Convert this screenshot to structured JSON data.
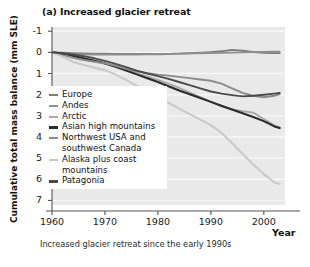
{
  "chart_data": {
    "type": "line",
    "title": "(a) Increased glacier retreat",
    "xlabel": "Year",
    "ylabel": "Cumulative total mass balance (mm SLE)",
    "caption": "Increased glacier retreat since the early 1990s",
    "xlim": [
      1960,
      2004
    ],
    "ylim": [
      7.5,
      -1.2
    ],
    "y_inverted": true,
    "grid": true,
    "legend_position": "inside-left",
    "xticks": [
      1960,
      1970,
      1980,
      1990,
      2000
    ],
    "xtick_labels": [
      "1960",
      "1970",
      "1980",
      "1990",
      "2000"
    ],
    "yticks": [
      -1,
      0,
      1,
      2,
      3,
      4,
      5,
      6,
      7
    ],
    "ytick_labels": [
      "-1",
      "0",
      "1",
      "2",
      "3",
      "4",
      "5",
      "6",
      "7"
    ],
    "x": [
      1960,
      1962,
      1964,
      1966,
      1968,
      1970,
      1972,
      1974,
      1976,
      1978,
      1980,
      1982,
      1984,
      1986,
      1988,
      1990,
      1992,
      1994,
      1996,
      1998,
      2000,
      2002,
      2003
    ],
    "series": [
      {
        "name": "Europe",
        "color": "#7d7d7d",
        "width": 1.9,
        "values": [
          0.0,
          0.02,
          0.04,
          0.05,
          0.06,
          0.06,
          0.07,
          0.07,
          0.08,
          0.08,
          0.09,
          0.08,
          0.06,
          0.04,
          0.02,
          -0.01,
          -0.05,
          -0.12,
          -0.08,
          -0.02,
          0.02,
          0.03,
          0.03
        ]
      },
      {
        "name": "Andes",
        "color": "#8f8f8f",
        "width": 1.8,
        "values": [
          0.0,
          0.04,
          0.07,
          0.09,
          0.1,
          0.11,
          0.11,
          0.11,
          0.1,
          0.09,
          0.08,
          0.07,
          0.06,
          0.05,
          0.04,
          0.03,
          0.02,
          0.01,
          0.0,
          -0.01,
          -0.02,
          -0.03,
          -0.03
        ]
      },
      {
        "name": "Arctic",
        "color": "#a8a8a8",
        "width": 1.9,
        "values": [
          0.0,
          0.1,
          0.22,
          0.32,
          0.42,
          0.52,
          0.66,
          0.82,
          0.98,
          1.14,
          1.3,
          1.48,
          1.68,
          1.9,
          2.12,
          2.34,
          2.55,
          2.7,
          2.78,
          2.85,
          3.15,
          3.45,
          3.55
        ]
      },
      {
        "name": "Asian high mountains",
        "color": "#2a2a2a",
        "width": 2.1,
        "values": [
          0.0,
          0.06,
          0.16,
          0.28,
          0.4,
          0.52,
          0.68,
          0.86,
          1.04,
          1.22,
          1.4,
          1.6,
          1.8,
          1.98,
          2.16,
          2.34,
          2.52,
          2.7,
          2.88,
          3.06,
          3.25,
          3.5,
          3.58
        ]
      },
      {
        "name": "Northwest USA and\nsouthwest Canada",
        "color": "#8b8b8b",
        "width": 1.9,
        "values": [
          0.0,
          0.12,
          0.26,
          0.36,
          0.44,
          0.52,
          0.64,
          0.78,
          0.9,
          0.98,
          1.05,
          1.1,
          1.16,
          1.22,
          1.28,
          1.34,
          1.48,
          1.7,
          1.92,
          2.05,
          2.12,
          2.05,
          1.97
        ]
      },
      {
        "name": "Alaska plus coast\nmountains",
        "color": "#c9c9c9",
        "width": 2.1,
        "values": [
          0.0,
          0.2,
          0.45,
          0.6,
          0.72,
          0.84,
          1.05,
          1.3,
          1.58,
          1.85,
          2.1,
          2.38,
          2.66,
          2.92,
          3.18,
          3.44,
          3.8,
          4.28,
          4.8,
          5.3,
          5.75,
          6.15,
          6.22
        ]
      },
      {
        "name": "Patagonia",
        "color": "#4a4a4a",
        "width": 1.9,
        "values": [
          0.0,
          0.05,
          0.1,
          0.18,
          0.28,
          0.4,
          0.54,
          0.7,
          0.86,
          1.0,
          1.12,
          1.25,
          1.4,
          1.55,
          1.7,
          1.85,
          1.95,
          2.02,
          2.08,
          2.05,
          2.0,
          1.95,
          1.92
        ]
      }
    ],
    "legend_entries": [
      {
        "label": "Europe",
        "color": "#7d7d7d",
        "thick": false
      },
      {
        "label": "Andes",
        "color": "#8f8f8f",
        "thick": false
      },
      {
        "label": "Arctic",
        "color": "#a8a8a8",
        "thick": false
      },
      {
        "label": "Asian high mountains",
        "color": "#2a2a2a",
        "thick": true
      },
      {
        "label": "Northwest USA and\nsouthwest Canada",
        "color": "#8b8b8b",
        "thick": false
      },
      {
        "label": "Alaska plus coast\nmountains",
        "color": "#c9c9c9",
        "thick": false
      },
      {
        "label": "Patagonia",
        "color": "#4a4a4a",
        "thick": true
      }
    ],
    "plot_bg": "#e9e9e9",
    "grid_color": "#f7f7f7"
  }
}
